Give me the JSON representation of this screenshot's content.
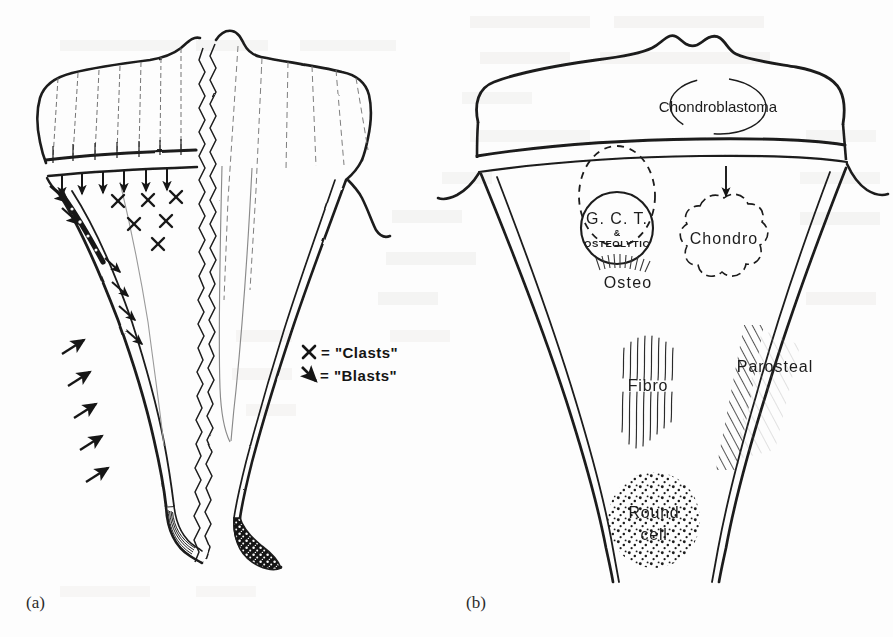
{
  "figure": {
    "caption_a": "(a)",
    "caption_b": "(b)",
    "background_color": "#fdfdfd",
    "ink_color": "#1b1b1b"
  },
  "panel_a": {
    "name": "growth-physiology-panel",
    "legend": [
      {
        "symbol": "X",
        "equals": "=",
        "label": "\"Clasts\""
      },
      {
        "symbol": "arrow",
        "equals": "=",
        "label": "\"Blasts\""
      }
    ],
    "legend_clasts_symbol": "X",
    "legend_clasts_text": "= \"Clasts\"",
    "legend_blasts_text": "= \"Blasts\"",
    "regions": [
      "epiphysis",
      "physis-growth-plate",
      "metaphysis",
      "diaphysis",
      "cortex",
      "marrow-cavity"
    ],
    "marker_counts": {
      "clast_x_marks": 6,
      "blast_arrows": 17
    }
  },
  "panel_b": {
    "name": "tumour-location-panel",
    "labels": [
      {
        "id": "chondroblastoma",
        "text": "Chondroblastoma",
        "x": 718,
        "y": 108,
        "shape": "ellipse-outline"
      },
      {
        "id": "gct",
        "text": "G. C. T.",
        "x": 617,
        "y": 222,
        "shape": "solid-circle-outline"
      },
      {
        "id": "gct-amp",
        "text": "&",
        "x": 617,
        "y": 232,
        "shape": "none"
      },
      {
        "id": "osteolytic",
        "text": "OSTEOLYTIC",
        "x": 617,
        "y": 241,
        "shape": "none"
      },
      {
        "id": "osteo",
        "text": "Osteo",
        "x": 628,
        "y": 272,
        "shape": "sunburst-hatch"
      },
      {
        "id": "chondro",
        "text": "Chondro",
        "x": 723,
        "y": 238,
        "shape": "cloud-outline"
      },
      {
        "id": "fibro",
        "text": "Fibro",
        "x": 646,
        "y": 385,
        "shape": "vertical-streaks"
      },
      {
        "id": "parosteal",
        "text": "Parosteal",
        "x": 777,
        "y": 366,
        "shape": "diagonal-hatch"
      },
      {
        "id": "round-cell-line1",
        "text": "Round",
        "x": 653,
        "y": 513,
        "shape": "stipple-dots"
      },
      {
        "id": "round-cell-line2",
        "text": "cell",
        "x": 653,
        "y": 533,
        "shape": "stipple-dots"
      }
    ],
    "chondroblastoma_text": "Chondroblastoma",
    "gct_text": "G. C. T.",
    "gct_amp_text": "&",
    "osteolytic_text": "OSTEOLYTIC",
    "osteo_text": "Osteo",
    "chondro_text": "Chondro",
    "fibro_text": "Fibro",
    "parosteal_text": "Parosteal",
    "round_text": "Round",
    "cell_text": "cell"
  }
}
